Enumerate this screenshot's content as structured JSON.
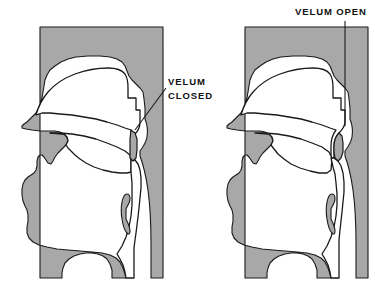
{
  "figure": {
    "background_color": "#ffffff",
    "tissue_fill": "#a8a8a8",
    "airway_fill": "#ffffff",
    "outline_color": "#1a1a1a",
    "leader_line_color": "#1a1a1a"
  },
  "labels": {
    "velum_closed": {
      "line1": "VELUM",
      "line2": "CLOSED",
      "x": 168,
      "y": 84
    },
    "velum_open": {
      "line1": "VELUM OPEN",
      "x": 295,
      "y": 16
    }
  },
  "panels": [
    {
      "id": "left-panel",
      "name": "velum-closed-diagram",
      "caption": "VELUM CLOSED",
      "state": "closed",
      "description": "Midsagittal section of the vocal tract with the soft palate raised so that it contacts the pharyngeal wall, sealing the nasal cavity from the oral cavity."
    },
    {
      "id": "right-panel",
      "name": "velum-open-diagram",
      "caption": "VELUM OPEN",
      "state": "open",
      "description": "Midsagittal section of the vocal tract with the soft palate lowered, leaving an open velopharyngeal port that connects the pharynx to the nasal cavity."
    }
  ]
}
